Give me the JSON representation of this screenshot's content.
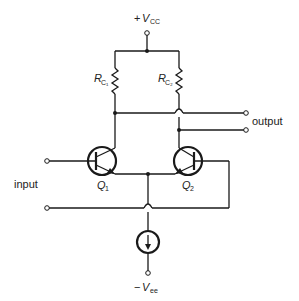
{
  "diagram": {
    "supply_top": {
      "sign": "+",
      "symbol": "V",
      "subscript": "CC"
    },
    "supply_bottom": {
      "sign": "−",
      "symbol": "V",
      "subscript": "ee"
    },
    "resistors": [
      {
        "symbol": "R",
        "subscript": "C₁"
      },
      {
        "symbol": "R",
        "subscript": "C₂"
      }
    ],
    "transistors": [
      {
        "symbol": "Q",
        "subscript": "1"
      },
      {
        "symbol": "Q",
        "subscript": "2"
      }
    ],
    "labels": {
      "input": "input",
      "output": "output"
    },
    "colors": {
      "line": "#1a1a1a",
      "background": "#ffffff"
    }
  }
}
